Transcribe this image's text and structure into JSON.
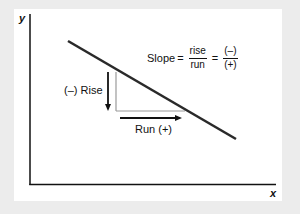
{
  "diagram": {
    "axes": {
      "x_label": "x",
      "y_label": "y"
    },
    "labels": {
      "rise": "(–) Rise",
      "run": "Run (+)"
    },
    "formula": {
      "lhs": "Slope",
      "equals": "=",
      "ratio_numerator": "rise",
      "ratio_denominator": "run",
      "sign_numerator": "(–)",
      "sign_denominator": "(+)"
    },
    "colors": {
      "line": "#2a2a2a",
      "triangle_legs": "#9a9a9a",
      "arrows": "#111111",
      "panel": "#ffffff",
      "background": "#ececec"
    }
  }
}
